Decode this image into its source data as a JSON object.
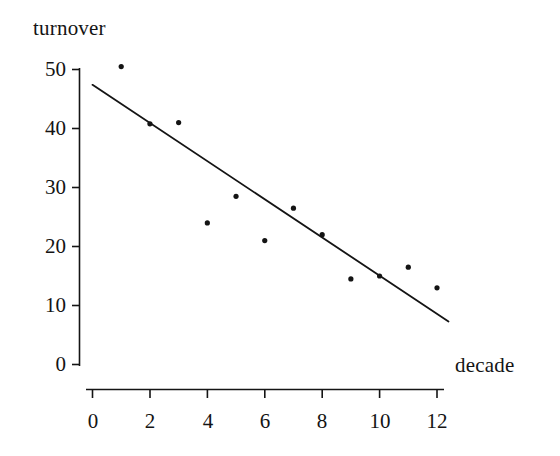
{
  "figure": {
    "background_color": "#ffffff",
    "ink_color": "#141414"
  },
  "chart_data": {
    "type": "scatter",
    "title": "",
    "subtitle": "",
    "xlabel": "decade",
    "ylabel": "turnover",
    "x": [
      1,
      2,
      3,
      4,
      5,
      6,
      7,
      8,
      9,
      10,
      11,
      12
    ],
    "values": [
      50.5,
      40.8,
      41.0,
      24.0,
      28.5,
      21.0,
      26.5,
      22.0,
      14.5,
      15.0,
      16.5,
      13.0
    ],
    "points": [
      {
        "x": 1,
        "y": 50.5
      },
      {
        "x": 2,
        "y": 40.8
      },
      {
        "x": 3,
        "y": 41.0
      },
      {
        "x": 4,
        "y": 24.0
      },
      {
        "x": 5,
        "y": 28.5
      },
      {
        "x": 6,
        "y": 21.0
      },
      {
        "x": 7,
        "y": 26.5
      },
      {
        "x": 8,
        "y": 22.0
      },
      {
        "x": 9,
        "y": 14.5
      },
      {
        "x": 10,
        "y": 15.0
      },
      {
        "x": 11,
        "y": 16.5
      },
      {
        "x": 12,
        "y": 13.0
      }
    ],
    "trendline": {
      "name": "fitted regression line",
      "x_start": 0,
      "y_start": 47.4,
      "x_end": 12.4,
      "y_end": 7.3
    },
    "xlim": [
      0,
      12.7
    ],
    "ylim": [
      0,
      50.8
    ],
    "xticks": [
      0,
      2,
      4,
      6,
      8,
      10,
      12
    ],
    "xtick_labels": [
      "0",
      "2",
      "4",
      "6",
      "8",
      "10",
      "12"
    ],
    "xminor_ticks": [
      1,
      3,
      5,
      7,
      9,
      11
    ],
    "yticks": [
      0,
      10,
      20,
      30,
      40,
      50
    ],
    "ytick_labels": [
      "0",
      "10",
      "20",
      "30",
      "40",
      "50"
    ],
    "grid": false,
    "legend": null,
    "marker": "dot",
    "marker_color": "#141414",
    "line_color": "#141414"
  }
}
